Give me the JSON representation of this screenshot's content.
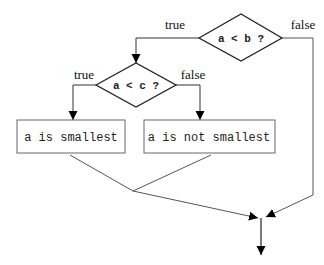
{
  "diagram": {
    "type": "flowchart",
    "decisions": [
      {
        "id": "d1",
        "label": "a < b ?",
        "true_label": "true",
        "false_label": "false"
      },
      {
        "id": "d2",
        "label": "a < c ?",
        "true_label": "true",
        "false_label": "false"
      }
    ],
    "boxes": [
      {
        "id": "b1",
        "label": "a is smallest"
      },
      {
        "id": "b2",
        "label": "a is not smallest"
      }
    ]
  }
}
